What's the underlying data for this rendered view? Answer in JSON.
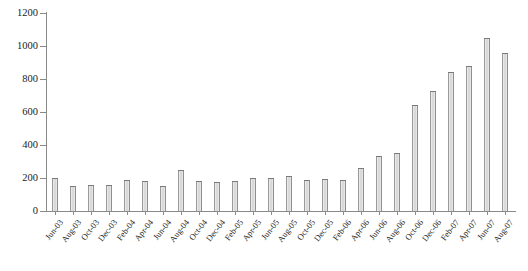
{
  "chart_data": {
    "type": "bar",
    "title": "",
    "subtitle": "",
    "xlabel": "",
    "ylabel": "",
    "ylim": [
      0,
      1200
    ],
    "yticks": [
      0,
      200,
      400,
      600,
      800,
      1000,
      1200
    ],
    "ytick_labels": [
      "0",
      "200",
      "400",
      "600",
      "800",
      "1000",
      "1200"
    ],
    "grid": false,
    "legend": null,
    "legend_position": "none",
    "categories": [
      "Jun-03",
      "Aug-03",
      "Oct-03",
      "Dec-03",
      "Feb-04",
      "Apr-04",
      "Jun-04",
      "Aug-04",
      "Oct-04",
      "Dec-04",
      "Feb-05",
      "Apr-05",
      "Jun-05",
      "Aug-05",
      "Oct-05",
      "Dec-05",
      "Feb-06",
      "Apr-06",
      "Jun-06",
      "Aug-06",
      "Oct-06",
      "Dec-06",
      "Feb-07",
      "Apr-07",
      "Jun-07",
      "Aug-07"
    ],
    "values": [
      200,
      150,
      160,
      155,
      185,
      180,
      150,
      250,
      180,
      175,
      180,
      200,
      200,
      210,
      185,
      195,
      190,
      260,
      335,
      350,
      640,
      725,
      845,
      880,
      1050,
      960
    ],
    "bar_color": "#e0e0e0",
    "bar_edge_color": "#7a7a7a",
    "axis_color": "#8a8a8a",
    "background_color": "#ffffff"
  }
}
